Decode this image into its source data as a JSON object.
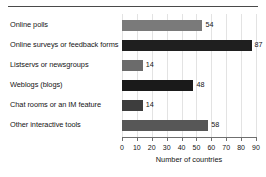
{
  "chart_data": {
    "type": "bar",
    "orientation": "horizontal",
    "title": "",
    "xlabel": "Number of countries",
    "ylabel": "",
    "xlim": [
      0,
      90
    ],
    "xticks": [
      0,
      10,
      20,
      30,
      40,
      50,
      60,
      70,
      80,
      90
    ],
    "xtick_labels": [
      "0",
      "10",
      "20",
      "30",
      "40",
      "50",
      "60",
      "70",
      "80",
      "90"
    ],
    "grid": true,
    "grid_axis": "x",
    "legend": false,
    "categories": [
      "Online polls",
      "Online surveys or feedback forms",
      "Listservs or newsgroups",
      "Weblogs (blogs)",
      "Chat rooms or an IM feature",
      "Other interactive tools"
    ],
    "values": [
      54,
      87,
      14,
      48,
      14,
      58
    ],
    "value_labels": [
      "54",
      "87",
      "14",
      "48",
      "14",
      "58"
    ],
    "bar_colors": [
      "#7a7a7a",
      "#1f1f1f",
      "#6b6b6b",
      "#1a1a1a",
      "#3d3d3d",
      "#575757"
    ]
  },
  "colors": {
    "background": "#ffffff",
    "text": "#141414",
    "axis": "#6f6f6f",
    "gridline": "#e3e3e3",
    "top_rule": "#4a4a4a"
  }
}
